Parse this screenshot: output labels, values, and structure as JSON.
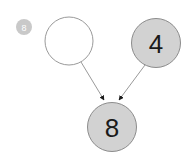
{
  "canvas": {
    "width": 195,
    "height": 164,
    "background": "#ffffff"
  },
  "badge": {
    "label": "8",
    "fill": "#c9c9c9",
    "text_color": "#ffffff",
    "cx": 24,
    "cy": 27,
    "r": 8
  },
  "graph": {
    "edge_color": "#9a9a9a",
    "arrow_color": "#1a1a1a",
    "node_stroke": "#8c8c8c",
    "filled_node_fill": "#d2d2d2",
    "empty_node_fill": "#ffffff",
    "nodes": [
      {
        "id": "node-empty",
        "label": "",
        "filled": false,
        "cx": 69,
        "cy": 41,
        "r": 24
      },
      {
        "id": "node-four",
        "label": "4",
        "filled": true,
        "cx": 156,
        "cy": 43,
        "r": 24.5
      },
      {
        "id": "node-eight",
        "label": "8",
        "filled": true,
        "cx": 112,
        "cy": 127,
        "r": 24.5
      }
    ],
    "edges": [
      {
        "id": "edge-empty-to-eight",
        "from": "node-empty",
        "to": "node-eight",
        "x1": 81,
        "y1": 62,
        "x2": 104,
        "y2": 100
      },
      {
        "id": "edge-four-to-eight",
        "from": "node-four",
        "to": "node-eight",
        "x1": 145,
        "y1": 65,
        "x2": 119,
        "y2": 100
      }
    ]
  }
}
